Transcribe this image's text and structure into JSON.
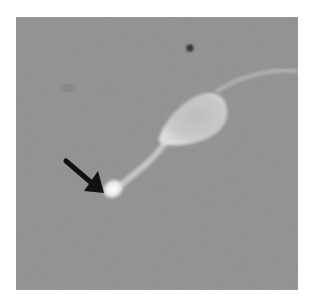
{
  "image": {
    "description": "Grayscale micrograph of a sperm cell with a black arrow pointing to a bright droplet at the end of the midpiece",
    "background_color": "#8f8f8f",
    "border_color": "#ffffff"
  },
  "annotations": {
    "arrow": {
      "color": "#111111",
      "points_to": "bright-droplet"
    }
  },
  "objects": {
    "sperm_head": {
      "color": "#cfcfcf"
    },
    "midpiece": {
      "color": "#c4c4c4"
    },
    "droplet": {
      "color": "#f2f2f2"
    },
    "tail": {
      "color": "#b8b8b8"
    },
    "debris_dot": {
      "color": "#2a2a2a"
    }
  }
}
